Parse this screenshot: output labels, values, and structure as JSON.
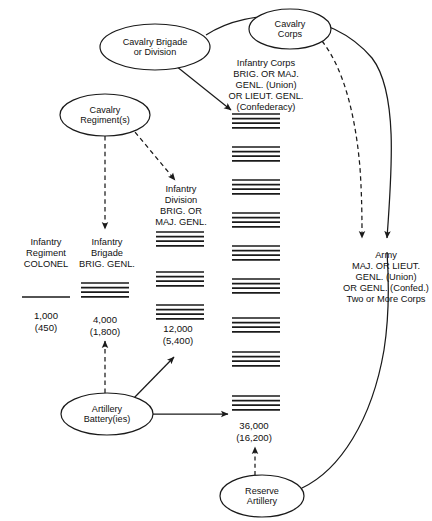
{
  "diagram": {
    "stroke_color": "#1a1a1a",
    "text_color": "#111111",
    "background": "#ffffff"
  },
  "nodes": [
    {
      "id": "cavalry-corps",
      "label": "Cavalry\nCorps",
      "cx": 290,
      "cy": 29,
      "rx": 41,
      "ry": 20
    },
    {
      "id": "cavalry-brigade",
      "label": "Cavalry Brigade\nor Division",
      "cx": 155,
      "cy": 47,
      "rx": 55,
      "ry": 23
    },
    {
      "id": "cavalry-regiment",
      "label": "Cavalry\nRegiment(s)",
      "cx": 105,
      "cy": 115,
      "rx": 45,
      "ry": 21
    },
    {
      "id": "artillery-battery",
      "label": "Artillery\nBattery(ies)",
      "cx": 107,
      "cy": 414,
      "rx": 46,
      "ry": 21
    },
    {
      "id": "reserve-artillery",
      "label": "Reserve\nArtillery",
      "cx": 262,
      "cy": 496,
      "rx": 42,
      "ry": 21
    }
  ],
  "text_blocks": [
    {
      "id": "infantry-corps-label",
      "text": "Infantry Corps\nBRIG. OR MAJ.\nGENL. (Union)\nOR LIEUT. GENL.\n(Confederacy)",
      "x": 213,
      "y": 58,
      "width": 106
    },
    {
      "id": "infantry-division-label",
      "text": "Infantry\nDivision\nBRIG. OR\nMAJ. GENL.",
      "x": 145,
      "y": 184,
      "width": 72
    },
    {
      "id": "infantry-brigade-label",
      "text": "Infantry\nBrigade\nBRIG.  GENL.",
      "x": 68,
      "y": 237,
      "width": 78
    },
    {
      "id": "infantry-regiment-label",
      "text": "Infantry\nRegiment\nCOLONEL",
      "x": 9,
      "y": 237,
      "width": 74
    },
    {
      "id": "army-label",
      "text": "Army\nMAJ. OR LIEUT.\nGENL. (Union)\nOR GENL. (Confed.)\nTwo or More Corps",
      "x": 341,
      "y": 250,
      "width": 90
    }
  ],
  "strength_labels": [
    {
      "id": "regiment-strength",
      "text": "1,000\n(450)",
      "x": 11,
      "y": 310,
      "width": 70
    },
    {
      "id": "brigade-strength",
      "text": "4,000\n(1,800)",
      "x": 70,
      "y": 314,
      "width": 70
    },
    {
      "id": "division-strength",
      "text": "12,000\n(5,400)",
      "x": 143,
      "y": 323,
      "width": 70
    },
    {
      "id": "corps-strength",
      "text": "36,000\n(16,200)",
      "x": 219,
      "y": 420,
      "width": 70
    }
  ],
  "unit_columns": [
    {
      "id": "regiment-column",
      "name": "infantry-regiment-stack",
      "x": 22,
      "width": 48,
      "groups": [
        {
          "top": 297,
          "lines": 1
        }
      ]
    },
    {
      "id": "brigade-column",
      "name": "infantry-brigade-stack",
      "x": 81,
      "width": 48,
      "groups": [
        {
          "top": 283,
          "lines": 4
        }
      ]
    },
    {
      "id": "division-column",
      "name": "infantry-division-stack",
      "x": 156,
      "width": 48,
      "groups": [
        {
          "top": 232,
          "lines": 4
        },
        {
          "top": 272,
          "lines": 4
        },
        {
          "top": 305,
          "lines": 4
        }
      ]
    },
    {
      "id": "corps-column",
      "name": "infantry-corps-stack",
      "x": 232,
      "width": 48,
      "groups": [
        {
          "top": 114,
          "lines": 4
        },
        {
          "top": 147,
          "lines": 4
        },
        {
          "top": 180,
          "lines": 4
        },
        {
          "top": 213,
          "lines": 4
        },
        {
          "top": 246,
          "lines": 4
        },
        {
          "top": 279,
          "lines": 4
        },
        {
          "top": 318,
          "lines": 4
        },
        {
          "top": 352,
          "lines": 4
        },
        {
          "top": 396,
          "lines": 4
        }
      ]
    }
  ],
  "connectors": [
    {
      "id": "cav-brigade-to-army-curve",
      "style": "solid",
      "arrow": true,
      "description": "Cavalry Brigade or Division curves right to Army"
    },
    {
      "id": "cav-corps-to-army-curve",
      "style": "dashed",
      "arrow": true,
      "description": "Cavalry Corps dashed curve down to Army"
    },
    {
      "id": "cav-brigade-to-corps",
      "style": "solid",
      "arrow": true,
      "description": "Cavalry Brigade to Infantry Corps stack"
    },
    {
      "id": "cav-regiment-to-division",
      "style": "dashed",
      "arrow": true,
      "description": "Cavalry Regiment to Infantry Division"
    },
    {
      "id": "cav-regiment-to-brigade",
      "style": "dashed",
      "arrow": true,
      "description": "Cavalry Regiment down to Infantry Brigade"
    },
    {
      "id": "battery-to-brigade",
      "style": "dashed",
      "arrow": true,
      "description": "Artillery Battery up to Infantry Brigade"
    },
    {
      "id": "battery-to-division",
      "style": "solid",
      "arrow": true,
      "description": "Artillery Battery to Infantry Division"
    },
    {
      "id": "battery-to-corps",
      "style": "solid",
      "arrow": true,
      "description": "Artillery Battery right to Infantry Corps"
    },
    {
      "id": "reserve-artillery-to-corps",
      "style": "dashed",
      "arrow": true,
      "description": "Reserve Artillery up to Corps 36,000"
    },
    {
      "id": "reserve-artillery-to-army",
      "style": "solid",
      "arrow": false,
      "description": "Reserve Artillery curve up right side to Army"
    }
  ]
}
